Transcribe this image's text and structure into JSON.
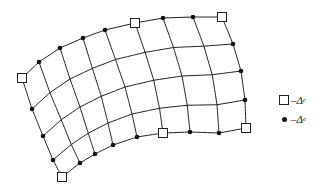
{
  "figure": {
    "stroke_color": "#222222",
    "grid": {
      "columns": 8,
      "rows": 4
    },
    "boundary": {
      "top": [
        [
          22,
          78
        ],
        [
          39,
          62
        ],
        [
          60,
          48
        ],
        [
          83,
          38
        ],
        [
          105,
          30
        ],
        [
          135,
          23
        ],
        [
          163,
          18
        ],
        [
          193,
          17
        ],
        [
          222,
          17
        ]
      ],
      "bottom": [
        [
          62,
          177
        ],
        [
          80,
          163
        ],
        [
          95,
          154
        ],
        [
          113,
          145
        ],
        [
          137,
          137
        ],
        [
          163,
          133
        ],
        [
          190,
          132
        ],
        [
          219,
          133
        ],
        [
          246,
          128
        ]
      ],
      "left": [
        [
          22,
          78
        ],
        [
          32,
          109
        ],
        [
          43,
          136
        ],
        [
          53,
          160
        ],
        [
          62,
          177
        ]
      ],
      "right": [
        [
          222,
          17
        ],
        [
          233,
          44
        ],
        [
          241,
          71
        ],
        [
          245,
          100
        ],
        [
          246,
          128
        ]
      ]
    },
    "square_nodes": [
      [
        22,
        78
      ],
      [
        135,
        23
      ],
      [
        222,
        17
      ],
      [
        246,
        128
      ],
      [
        163,
        133
      ],
      [
        62,
        177
      ]
    ],
    "dot_nodes": [
      [
        39,
        62
      ],
      [
        60,
        48
      ],
      [
        83,
        38
      ],
      [
        105,
        30
      ],
      [
        163,
        18
      ],
      [
        193,
        17
      ],
      [
        233,
        44
      ],
      [
        241,
        71
      ],
      [
        245,
        100
      ],
      [
        80,
        163
      ],
      [
        95,
        154
      ],
      [
        113,
        145
      ],
      [
        137,
        137
      ],
      [
        190,
        132
      ],
      [
        219,
        133
      ],
      [
        32,
        109
      ],
      [
        43,
        136
      ],
      [
        53,
        160
      ]
    ]
  },
  "legend": {
    "items": [
      {
        "symbol": "square",
        "dash": "–",
        "label": "Δ",
        "subscript": "c"
      },
      {
        "symbol": "dot",
        "dash": "–",
        "label": "Δ",
        "subscript": "e"
      }
    ]
  }
}
